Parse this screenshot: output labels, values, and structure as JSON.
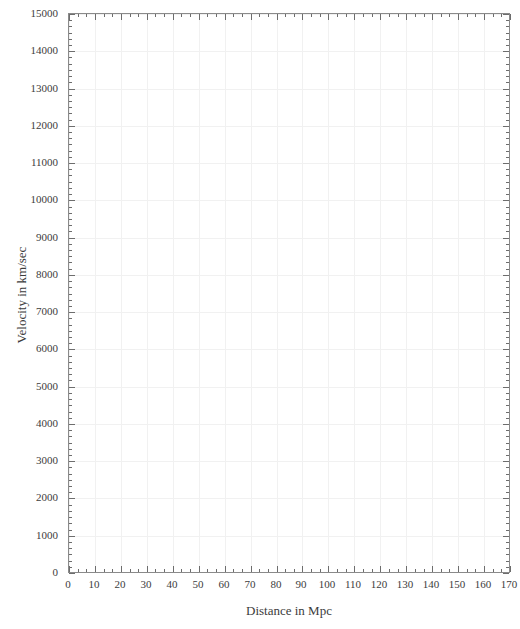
{
  "chart_data": {
    "type": "scatter",
    "title": "",
    "subtitle": "",
    "xlabel": "Distance in Mpc",
    "ylabel": "Velocity in km/sec",
    "xlim": [
      0,
      170
    ],
    "ylim": [
      0,
      15000
    ],
    "xticks": [
      0,
      10,
      20,
      30,
      40,
      50,
      60,
      70,
      80,
      90,
      100,
      110,
      120,
      130,
      140,
      150,
      160,
      170
    ],
    "xtick_labels": [
      "0",
      "10",
      "20",
      "30",
      "40",
      "50",
      "60",
      "70",
      "80",
      "90",
      "100",
      "110",
      "120",
      "130",
      "140",
      "150",
      "160",
      "170"
    ],
    "yticks": [
      0,
      1000,
      2000,
      3000,
      4000,
      5000,
      6000,
      7000,
      8000,
      9000,
      10000,
      11000,
      12000,
      13000,
      14000,
      15000
    ],
    "ytick_labels": [
      "0",
      "1000",
      "2000",
      "3000",
      "4000",
      "5000",
      "6000",
      "7000",
      "8000",
      "9000",
      "10000",
      "11000",
      "12000",
      "13000",
      "14000",
      "15000"
    ],
    "x_minor_per_major": 2,
    "y_minor_per_major": 5,
    "grid": true,
    "grid_color": "#f1f1f1",
    "frame_color": "#8a8a8a",
    "tick_color": "#6d6d6d",
    "text_color": "#3c3c3c",
    "background": "#ffffff",
    "legend": null,
    "legend_position": "none",
    "annotations": [],
    "series": [
      {
        "name": "",
        "x": [],
        "y": []
      }
    ]
  }
}
